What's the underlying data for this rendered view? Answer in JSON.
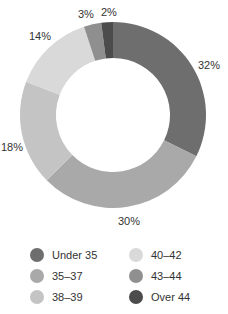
{
  "chart_data": {
    "type": "pie",
    "variant": "donut",
    "title": "",
    "categories": [
      "Under 35",
      "35–37",
      "38–39",
      "40–42",
      "43–44",
      "Over 44"
    ],
    "values": [
      32,
      30,
      18,
      14,
      3,
      2
    ],
    "unit": "%",
    "colors": [
      "#6e6e6e",
      "#a9a9a9",
      "#c4c4c4",
      "#d9d9d9",
      "#8f8f8f",
      "#4c4c4c"
    ],
    "start_angle": "top (12 o'clock), clockwise",
    "legend_position": "bottom, two columns"
  },
  "labels": {
    "under35": "32%",
    "a35_37": "30%",
    "a38_39": "18%",
    "a40_42": "14%",
    "a43_44": "3%",
    "over44": "2%"
  },
  "legend": {
    "items": [
      {
        "label": "Under 35",
        "color": "#6e6e6e"
      },
      {
        "label": "35–37",
        "color": "#a9a9a9"
      },
      {
        "label": "38–39",
        "color": "#c4c4c4"
      },
      {
        "label": "40–42",
        "color": "#d9d9d9"
      },
      {
        "label": "43–44",
        "color": "#8f8f8f"
      },
      {
        "label": "Over 44",
        "color": "#4c4c4c"
      }
    ]
  }
}
